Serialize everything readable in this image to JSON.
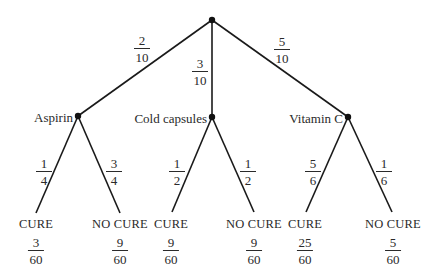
{
  "diagram": {
    "type": "probability-tree",
    "root": {
      "x": 212,
      "y": 20
    },
    "colors": {
      "line": "#1a1a1a",
      "node": "#111111",
      "text": "#2a2a2a",
      "background": "#ffffff"
    },
    "branches": [
      {
        "label": "Aspirin",
        "probability": {
          "num": "2",
          "den": "10"
        },
        "node": {
          "x": 78,
          "y": 116
        },
        "children": [
          {
            "outcome": "CURE",
            "probability": {
              "num": "1",
              "den": "4"
            },
            "result": {
              "num": "3",
              "den": "60"
            }
          },
          {
            "outcome": "NO CURE",
            "probability": {
              "num": "3",
              "den": "4"
            },
            "result": {
              "num": "9",
              "den": "60"
            }
          }
        ]
      },
      {
        "label": "Cold capsules",
        "probability": {
          "num": "3",
          "den": "10"
        },
        "node": {
          "x": 212,
          "y": 117
        },
        "children": [
          {
            "outcome": "CURE",
            "probability": {
              "num": "1",
              "den": "2"
            },
            "result": {
              "num": "9",
              "den": "60"
            }
          },
          {
            "outcome": "NO CURE",
            "probability": {
              "num": "1",
              "den": "2"
            },
            "result": {
              "num": "9",
              "den": "60"
            }
          }
        ]
      },
      {
        "label": "Vitamin C",
        "probability": {
          "num": "5",
          "den": "10"
        },
        "node": {
          "x": 348,
          "y": 117
        },
        "children": [
          {
            "outcome": "CURE",
            "probability": {
              "num": "5",
              "den": "6"
            },
            "result": {
              "num": "25",
              "den": "60"
            }
          },
          {
            "outcome": "NO CURE",
            "probability": {
              "num": "1",
              "den": "6"
            },
            "result": {
              "num": "5",
              "den": "60"
            }
          }
        ]
      }
    ]
  }
}
